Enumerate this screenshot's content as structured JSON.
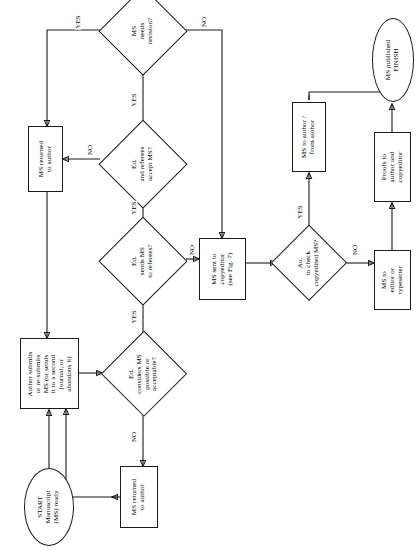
{
  "diagram": {
    "orientation": "rotated-90-ccw",
    "nodes": [
      {
        "id": "start",
        "type": "ellipse",
        "text": "START\nManuscript\n(MS) ready"
      },
      {
        "id": "author",
        "type": "box",
        "text": "Author submits\nor re-submits\nMS (or sends\nit to a second\njournal, or\nabandons it)"
      },
      {
        "id": "ed_considers",
        "type": "diamond",
        "text": "Ed.\nconsiders MS\npossible or\nacceptable?"
      },
      {
        "id": "ret_author_b",
        "type": "box",
        "text": "MS returned\nto author"
      },
      {
        "id": "ed_sends",
        "type": "diamond",
        "text": "Ed.\nsends MS\nto referees?"
      },
      {
        "id": "ed_accept",
        "type": "diamond",
        "text": "Ed.\nand referees\naccept MS?"
      },
      {
        "id": "ret_author_t",
        "type": "box",
        "text": "MS returned\nto author"
      },
      {
        "id": "ms_revision",
        "type": "diamond",
        "text": "MS\nneeds\nrevision?"
      },
      {
        "id": "copyeditor",
        "type": "box",
        "text": "MS sent to\ncopyeditor\n(see Fig. 7)"
      },
      {
        "id": "au_check",
        "type": "diamond",
        "text": "Au.\nto check\ncopyedited MS?"
      },
      {
        "id": "ms_to_author",
        "type": "box",
        "text": "MS to author /\nfrom author"
      },
      {
        "id": "ms_to_editor",
        "type": "box",
        "text": "MS to\neditor or\ntypesetter"
      },
      {
        "id": "proofs",
        "type": "box",
        "text": "Proofs to\nauthor and\ncopyeditor"
      },
      {
        "id": "finish",
        "type": "ellipse",
        "text": "MS published\nFINISH"
      }
    ],
    "edge_labels": [
      {
        "id": "e1",
        "text": "YES",
        "from": "ed_considers",
        "to": "ed_sends"
      },
      {
        "id": "e2",
        "text": "NO",
        "from": "ed_considers",
        "to": "ret_author_b"
      },
      {
        "id": "e3",
        "text": "YES",
        "from": "ed_sends",
        "to": "ed_accept"
      },
      {
        "id": "e4",
        "text": "NO",
        "from": "ed_sends",
        "to": "copyeditor"
      },
      {
        "id": "e5",
        "text": "YES",
        "from": "ed_accept",
        "to": "ms_revision"
      },
      {
        "id": "e6",
        "text": "NO",
        "from": "ed_accept",
        "to": "ret_author_t"
      },
      {
        "id": "e7",
        "text": "YES",
        "from": "ms_revision",
        "to": "ret_author_t"
      },
      {
        "id": "e8",
        "text": "NO",
        "from": "ms_revision",
        "to": "copyeditor"
      },
      {
        "id": "e9",
        "text": "YES",
        "from": "au_check",
        "to": "ms_to_author"
      },
      {
        "id": "e10",
        "text": "NO",
        "from": "au_check",
        "to": "ms_to_editor"
      }
    ],
    "colors": {
      "stroke": "#1a1a1a",
      "fill": "#ffffff",
      "text": "#000000"
    }
  }
}
